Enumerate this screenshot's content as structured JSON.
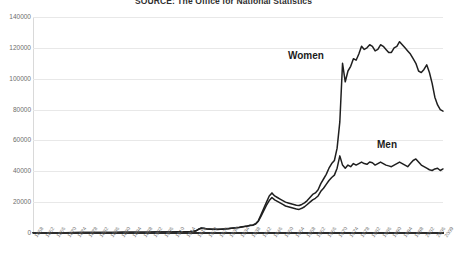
{
  "chart_data": {
    "type": "line",
    "title": "SOURCE: The Office for National Statistics",
    "xlabel": "",
    "ylabel": "",
    "ylim": [
      0,
      140000
    ],
    "ytick_labels": [
      "140000",
      "120000",
      "100000",
      "80000",
      "60000",
      "40000",
      "20000",
      "0"
    ],
    "ytick_values": [
      140000,
      120000,
      100000,
      80000,
      60000,
      40000,
      20000,
      0
    ],
    "grid": true,
    "legend_position": "inline-annotations",
    "x_start": 1858,
    "x_end": 2009,
    "x_step": 4,
    "categories": [
      "1858",
      "1862",
      "1866",
      "1870",
      "1874",
      "1878",
      "1882",
      "1886",
      "1890",
      "1894",
      "1898",
      "1902",
      "1906",
      "1910",
      "1914",
      "1918",
      "1922",
      "1926",
      "1930",
      "1934",
      "1938",
      "1942",
      "1946",
      "1950",
      "1954",
      "1958",
      "1962",
      "1966",
      "1970",
      "1974",
      "1978",
      "1982",
      "1986",
      "1990",
      "1994",
      "1998",
      "2002",
      "2006",
      "2009"
    ],
    "xtick_labels": [
      "1858",
      "1862",
      "1866",
      "1870",
      "1874",
      "1878",
      "1882",
      "1886",
      "1890",
      "1894",
      "1898",
      "1902",
      "1906",
      "1910",
      "1914",
      "1918",
      "1922",
      "1926",
      "1930",
      "1934",
      "1938",
      "1942",
      "1946",
      "1950",
      "1954",
      "1958",
      "1962",
      "1966",
      "1970",
      "1974",
      "1978",
      "1982",
      "1986",
      "1990",
      "1994",
      "1998",
      "2002",
      "2006",
      "2009"
    ],
    "series": [
      {
        "name": "Women",
        "color": "#1f1f1f",
        "label_annotation": "Women",
        "x": [
          1858,
          1861,
          1864,
          1867,
          1870,
          1873,
          1876,
          1879,
          1882,
          1885,
          1888,
          1891,
          1894,
          1897,
          1900,
          1903,
          1906,
          1909,
          1912,
          1914,
          1915,
          1916,
          1917,
          1918,
          1919,
          1920,
          1921,
          1922,
          1923,
          1924,
          1925,
          1926,
          1927,
          1928,
          1929,
          1930,
          1931,
          1932,
          1933,
          1934,
          1935,
          1936,
          1937,
          1938,
          1939,
          1940,
          1941,
          1942,
          1943,
          1944,
          1945,
          1946,
          1947,
          1948,
          1949,
          1950,
          1951,
          1952,
          1953,
          1954,
          1955,
          1956,
          1957,
          1958,
          1959,
          1960,
          1961,
          1962,
          1963,
          1964,
          1965,
          1966,
          1967,
          1968,
          1969,
          1970,
          1971,
          1972,
          1973,
          1974,
          1975,
          1976,
          1977,
          1978,
          1979,
          1980,
          1981,
          1982,
          1983,
          1984,
          1985,
          1986,
          1987,
          1988,
          1989,
          1990,
          1991,
          1992,
          1993,
          1994,
          1995,
          1996,
          1997,
          1998,
          1999,
          2000,
          2001,
          2002,
          2003,
          2004,
          2005,
          2006,
          2007,
          2008,
          2009
        ],
        "values": [
          180,
          190,
          200,
          210,
          230,
          250,
          270,
          300,
          330,
          360,
          400,
          450,
          480,
          520,
          560,
          600,
          650,
          700,
          760,
          800,
          850,
          900,
          1100,
          1400,
          2500,
          3200,
          3000,
          2700,
          2600,
          2500,
          2450,
          2400,
          2500,
          2600,
          2700,
          2900,
          3100,
          3300,
          3500,
          3700,
          4000,
          4300,
          4600,
          5000,
          5200,
          6000,
          8000,
          12000,
          16000,
          20000,
          24000,
          26000,
          24000,
          23000,
          22000,
          21000,
          20000,
          19500,
          19000,
          18500,
          18000,
          17800,
          18500,
          19500,
          21000,
          23000,
          25000,
          26000,
          28000,
          32000,
          35000,
          38000,
          42000,
          45000,
          47000,
          55000,
          72000,
          110000,
          98000,
          105000,
          108000,
          113000,
          112000,
          116000,
          121000,
          119000,
          120000,
          122000,
          121000,
          118000,
          119000,
          122000,
          121000,
          119000,
          117000,
          117000,
          120000,
          121000,
          124000,
          122000,
          120000,
          118000,
          116000,
          113000,
          110000,
          105000,
          104000,
          106000,
          109000,
          104000,
          97000,
          88000,
          83000,
          80000,
          79000
        ]
      },
      {
        "name": "Men",
        "color": "#1f1f1f",
        "label_annotation": "Men",
        "x": [
          1858,
          1861,
          1864,
          1867,
          1870,
          1873,
          1876,
          1879,
          1882,
          1885,
          1888,
          1891,
          1894,
          1897,
          1900,
          1903,
          1906,
          1909,
          1912,
          1914,
          1915,
          1916,
          1917,
          1918,
          1919,
          1920,
          1921,
          1922,
          1923,
          1924,
          1925,
          1926,
          1927,
          1928,
          1929,
          1930,
          1931,
          1932,
          1933,
          1934,
          1935,
          1936,
          1937,
          1938,
          1939,
          1940,
          1941,
          1942,
          1943,
          1944,
          1945,
          1946,
          1947,
          1948,
          1949,
          1950,
          1951,
          1952,
          1953,
          1954,
          1955,
          1956,
          1957,
          1958,
          1959,
          1960,
          1961,
          1962,
          1963,
          1964,
          1965,
          1966,
          1967,
          1968,
          1969,
          1970,
          1971,
          1972,
          1973,
          1974,
          1975,
          1976,
          1977,
          1978,
          1979,
          1980,
          1981,
          1982,
          1983,
          1984,
          1985,
          1986,
          1987,
          1988,
          1989,
          1990,
          1991,
          1992,
          1993,
          1994,
          1995,
          1996,
          1997,
          1998,
          1999,
          2000,
          2001,
          2002,
          2003,
          2004,
          2005,
          2006,
          2007,
          2008,
          2009
        ],
        "values": [
          170,
          180,
          190,
          200,
          220,
          240,
          260,
          290,
          320,
          350,
          390,
          430,
          460,
          500,
          540,
          580,
          620,
          670,
          730,
          780,
          820,
          870,
          1050,
          1350,
          2400,
          3100,
          2900,
          2600,
          2500,
          2400,
          2350,
          2300,
          2400,
          2500,
          2600,
          2800,
          3000,
          3200,
          3400,
          3600,
          3900,
          4200,
          4500,
          4900,
          5100,
          5800,
          7600,
          11000,
          14500,
          18000,
          21000,
          23000,
          21500,
          20500,
          19500,
          18500,
          17500,
          17000,
          16500,
          16000,
          15500,
          15300,
          16000,
          17000,
          18500,
          20000,
          21500,
          22500,
          24000,
          27000,
          29000,
          31500,
          34000,
          36000,
          37500,
          42000,
          50000,
          44000,
          42000,
          44000,
          43000,
          45000,
          44000,
          45000,
          46000,
          45000,
          44500,
          46000,
          45500,
          44000,
          45000,
          46000,
          45000,
          44000,
          43500,
          43000,
          44000,
          45000,
          46000,
          45000,
          44000,
          43000,
          45000,
          47000,
          48000,
          46000,
          44000,
          43000,
          42000,
          41000,
          40500,
          41500,
          42000,
          40500,
          41500
        ]
      }
    ],
    "annotations": [
      {
        "text": "Women",
        "x": 1978,
        "y": 108000
      },
      {
        "text": "Men",
        "x": 2001,
        "y": 56000
      }
    ]
  }
}
